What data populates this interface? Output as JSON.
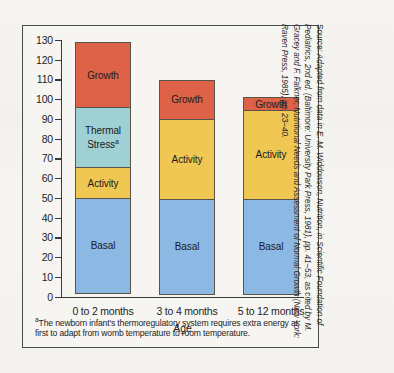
{
  "figure": {
    "footnote_marker": "a",
    "footnote_text": "The newborn infant's thermoregulatory system requires extra energy at first to adapt from womb temperature to room temperature.",
    "source_label": "Source:",
    "source_text": "Adapted from data in E. M. Widdowson, Nutrition, in Scientific Foundation of Pediatrics, 2nd ed. (Baltimore: University Park Press, 1981), pp. 41–53, as cited by M. Gracey and F. Falkner, Nutritional Needs and Assessment of Normal Growth (New York: Raven Press, 1985), pp. 23–40."
  },
  "colors": {
    "growth": "#DE6248",
    "thermal_stress": "#9FD0D3",
    "activity": "#F0C752",
    "basal": "#8CB8E4",
    "axis": "#3a3a3a",
    "panel_border": "#4a4a4a",
    "segment_border": "#5c5348",
    "page_background": "#f4f2ef"
  },
  "chart_data": {
    "type": "bar",
    "subtype": "stacked",
    "title": "",
    "xlabel": "Age",
    "ylabel": "",
    "ylim": [
      0,
      130
    ],
    "ytick_step": 10,
    "yticks": [
      0,
      10,
      20,
      30,
      40,
      50,
      60,
      70,
      80,
      90,
      100,
      110,
      120,
      130
    ],
    "ytick_labels": [
      "0",
      "10",
      "20",
      "30",
      "40",
      "50",
      "60",
      "70",
      "80",
      "90",
      "100",
      "110",
      "120",
      "130"
    ],
    "grid": false,
    "legend": "inline-segment-labels",
    "categories": [
      "0 to 2 months",
      "3 to 4 months",
      "5 to 12 months"
    ],
    "series": [
      {
        "name": "Basal",
        "values": [
          48.5,
          48.5,
          48.5
        ]
      },
      {
        "name": "Activity",
        "values": [
          16.0,
          41.0,
          45.5
        ]
      },
      {
        "name": "Thermal Stress",
        "values": [
          31.0,
          0.0,
          0.0
        ]
      },
      {
        "name": "Growth",
        "values": [
          33.5,
          20.5,
          7.0
        ]
      }
    ],
    "totals": [
      129.0,
      110.0,
      101.0
    ],
    "bars": [
      {
        "category": "0 to 2 months",
        "total": 129.0,
        "segments": [
          {
            "label": "Growth",
            "value": 33.5,
            "from": 95.5,
            "to": 129.0,
            "color": "#DE6248",
            "footnote": ""
          },
          {
            "label": "Thermal Stress",
            "value": 31.0,
            "from": 64.5,
            "to": 95.5,
            "color": "#9FD0D3",
            "footnote": "a"
          },
          {
            "label": "Activity",
            "value": 16.0,
            "from": 48.5,
            "to": 64.5,
            "color": "#F0C752",
            "footnote": ""
          },
          {
            "label": "Basal",
            "value": 48.5,
            "from": 0.0,
            "to": 48.5,
            "color": "#8CB8E4",
            "footnote": ""
          }
        ]
      },
      {
        "category": "3 to 4 months",
        "total": 110.0,
        "segments": [
          {
            "label": "Growth",
            "value": 20.5,
            "from": 89.5,
            "to": 110.0,
            "color": "#DE6248",
            "footnote": ""
          },
          {
            "label": "Activity",
            "value": 41.0,
            "from": 48.5,
            "to": 89.5,
            "color": "#F0C752",
            "footnote": ""
          },
          {
            "label": "Basal",
            "value": 48.5,
            "from": 0.0,
            "to": 48.5,
            "color": "#8CB8E4",
            "footnote": ""
          }
        ]
      },
      {
        "category": "5 to 12 months",
        "total": 101.0,
        "segments": [
          {
            "label": "Growth",
            "value": 7.0,
            "from": 94.0,
            "to": 101.0,
            "color": "#DE6248",
            "footnote": ""
          },
          {
            "label": "Activity",
            "value": 45.5,
            "from": 48.5,
            "to": 94.0,
            "color": "#F0C752",
            "footnote": ""
          },
          {
            "label": "Basal",
            "value": 48.5,
            "from": 0.0,
            "to": 48.5,
            "color": "#8CB8E4",
            "footnote": ""
          }
        ]
      }
    ]
  }
}
